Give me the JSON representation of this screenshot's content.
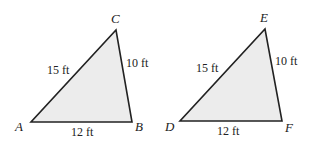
{
  "diagram": {
    "colors": {
      "fill": "#ececec",
      "stroke": "#222222",
      "text": "#222222"
    },
    "triangles": [
      {
        "name": "ABC",
        "vertices": {
          "A": {
            "label": "A",
            "x": 31,
            "y": 122
          },
          "B": {
            "label": "B",
            "x": 132,
            "y": 122
          },
          "C": {
            "label": "C",
            "x": 116,
            "y": 30
          }
        },
        "sides": {
          "AC": "15 ft",
          "CB": "10 ft",
          "AB": "12 ft"
        }
      },
      {
        "name": "DEF",
        "vertices": {
          "D": {
            "label": "D",
            "x": 180,
            "y": 121
          },
          "F": {
            "label": "F",
            "x": 282,
            "y": 121
          },
          "E": {
            "label": "E",
            "x": 265,
            "y": 29
          }
        },
        "sides": {
          "DE": "15 ft",
          "EF": "10 ft",
          "DF": "12 ft"
        }
      }
    ]
  }
}
